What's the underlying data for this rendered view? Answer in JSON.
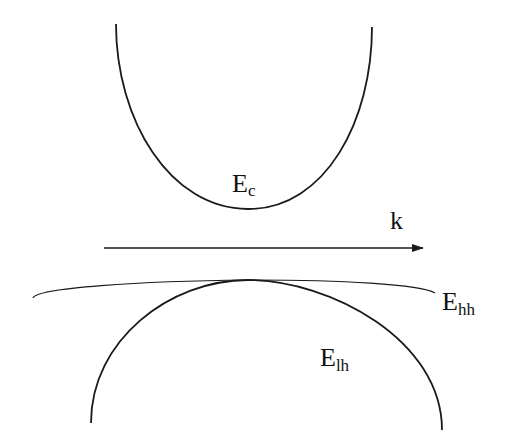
{
  "diagram": {
    "axis": {
      "label": "k",
      "direction": "right"
    },
    "bands": [
      {
        "id": "conduction",
        "label_main": "E",
        "label_sub": "c",
        "shape": "parabola-up"
      },
      {
        "id": "heavy-hole",
        "label_main": "E",
        "label_sub": "hh",
        "shape": "flat-parabola-down"
      },
      {
        "id": "light-hole",
        "label_main": "E",
        "label_sub": "lh",
        "shape": "parabola-down"
      }
    ]
  },
  "colors": {
    "line": "#1a1a1a",
    "background": "#ffffff"
  }
}
